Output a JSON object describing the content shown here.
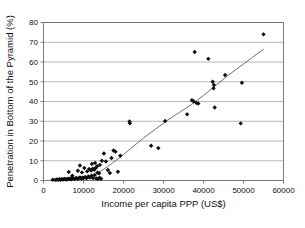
{
  "chart_data": {
    "type": "scatter",
    "title": "",
    "xlabel": "Income per capita PPP (US$)",
    "ylabel": "Penetration in Bottom of the Pyramid (%)",
    "xlim": [
      0,
      60000
    ],
    "ylim": [
      0,
      80
    ],
    "xticks": [
      0,
      10000,
      20000,
      30000,
      40000,
      50000,
      60000
    ],
    "yticks": [
      0,
      10,
      20,
      30,
      40,
      50,
      60,
      70,
      80
    ],
    "xtick_labels": [
      "0",
      "10000",
      "20000",
      "30000",
      "40000",
      "50000",
      "60000"
    ],
    "ytick_labels": [
      "0",
      "10",
      "20",
      "30",
      "40",
      "50",
      "60",
      "70",
      "80"
    ],
    "grid": "horizontal",
    "legend": "none",
    "marker": "diamond",
    "marker_color": "#0d0d0d",
    "trendline": {
      "present": true,
      "style": "smooth-curve",
      "color": "#5d5d5d",
      "points": [
        [
          10500,
          0.5
        ],
        [
          13000,
          3.0
        ],
        [
          16000,
          7.0
        ],
        [
          19000,
          11.5
        ],
        [
          22000,
          16.5
        ],
        [
          25000,
          21.5
        ],
        [
          28000,
          26.0
        ],
        [
          31000,
          30.5
        ],
        [
          34000,
          34.5
        ],
        [
          37000,
          38.5
        ],
        [
          40000,
          43.0
        ],
        [
          43000,
          48.0
        ],
        [
          46000,
          53.0
        ],
        [
          49000,
          57.5
        ],
        [
          52000,
          62.0
        ],
        [
          55000,
          66.5
        ]
      ]
    },
    "series": [
      {
        "name": "Countries",
        "points": [
          [
            2300,
            0.4
          ],
          [
            2900,
            0.3
          ],
          [
            3300,
            0.5
          ],
          [
            3700,
            0.4
          ],
          [
            4000,
            0.6
          ],
          [
            4300,
            0.4
          ],
          [
            4600,
            0.7
          ],
          [
            4900,
            0.5
          ],
          [
            5200,
            0.8
          ],
          [
            5500,
            0.6
          ],
          [
            5800,
            0.5
          ],
          [
            6100,
            0.9
          ],
          [
            6400,
            0.7
          ],
          [
            6700,
            1.0
          ],
          [
            7000,
            0.6
          ],
          [
            7300,
            1.2
          ],
          [
            7600,
            0.8
          ],
          [
            7900,
            1.0
          ],
          [
            8200,
            1.3
          ],
          [
            8500,
            0.9
          ],
          [
            8800,
            1.1
          ],
          [
            9100,
            1.5
          ],
          [
            9400,
            1.0
          ],
          [
            9700,
            1.4
          ],
          [
            10000,
            1.2
          ],
          [
            10400,
            1.8
          ],
          [
            10800,
            1.3
          ],
          [
            11200,
            2.0
          ],
          [
            11600,
            1.5
          ],
          [
            12000,
            2.4
          ],
          [
            12400,
            1.2
          ],
          [
            12800,
            2.8
          ],
          [
            13200,
            1.0
          ],
          [
            13600,
            0.8
          ],
          [
            14000,
            1.4
          ],
          [
            14400,
            0.9
          ],
          [
            6300,
            4.3
          ],
          [
            7200,
            2.4
          ],
          [
            8600,
            4.9
          ],
          [
            9100,
            7.6
          ],
          [
            9600,
            4.1
          ],
          [
            10200,
            6.3
          ],
          [
            10900,
            4.6
          ],
          [
            11400,
            5.8
          ],
          [
            11900,
            5.1
          ],
          [
            12300,
            6.0
          ],
          [
            12700,
            5.4
          ],
          [
            13100,
            6.4
          ],
          [
            13500,
            4.0
          ],
          [
            13900,
            3.7
          ],
          [
            12100,
            8.4
          ],
          [
            12900,
            8.9
          ],
          [
            13400,
            7.2
          ],
          [
            14100,
            7.9
          ],
          [
            14600,
            10.0
          ],
          [
            15100,
            13.7
          ],
          [
            15600,
            9.6
          ],
          [
            16100,
            5.3
          ],
          [
            16600,
            3.8
          ],
          [
            17000,
            11.4
          ],
          [
            17500,
            15.2
          ],
          [
            18000,
            14.6
          ],
          [
            18600,
            4.4
          ],
          [
            19200,
            12.5
          ],
          [
            21500,
            29.9
          ],
          [
            21600,
            29.0
          ],
          [
            26900,
            17.6
          ],
          [
            28700,
            16.4
          ],
          [
            30400,
            30.1
          ],
          [
            35900,
            33.5
          ],
          [
            37100,
            40.6
          ],
          [
            37500,
            40.1
          ],
          [
            38200,
            39.3
          ],
          [
            38700,
            39.0
          ],
          [
            37800,
            65.1
          ],
          [
            41200,
            61.6
          ],
          [
            42300,
            50.0
          ],
          [
            42500,
            46.7
          ],
          [
            42600,
            48.4
          ],
          [
            42800,
            37.0
          ],
          [
            45400,
            53.4
          ],
          [
            49300,
            28.9
          ],
          [
            49600,
            49.5
          ],
          [
            55000,
            74.0
          ]
        ]
      }
    ]
  }
}
